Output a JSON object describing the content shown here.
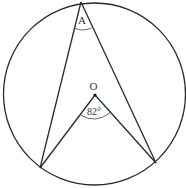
{
  "diagram": {
    "type": "inscribed-and-central-angle",
    "circle": {
      "cx": 94.5,
      "cy": 94,
      "r": 91
    },
    "points": {
      "A": {
        "x": 81,
        "y": 2,
        "label": "A"
      },
      "O": {
        "x": 95,
        "y": 95,
        "label": "O"
      },
      "B": {
        "x": 40,
        "y": 168
      },
      "C": {
        "x": 156,
        "y": 163
      }
    },
    "labels": {
      "vertex_a": "A",
      "center_o": "O",
      "central_angle": "82°"
    },
    "colors": {
      "line": "#2a2a2a",
      "background": "#ffffff"
    }
  }
}
